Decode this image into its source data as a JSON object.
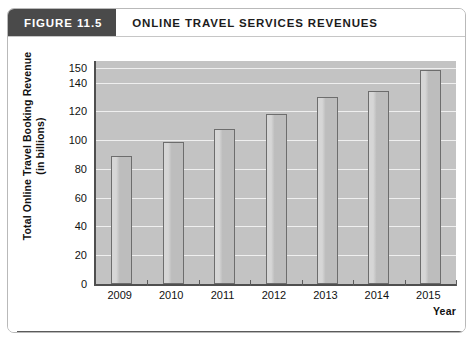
{
  "header": {
    "figure_tag": "FIGURE 11.5",
    "title": "ONLINE TRAVEL SERVICES REVENUES"
  },
  "colors": {
    "tag_background": "#4a4a4a",
    "tag_text": "#ffffff",
    "title_text": "#1c1c1c",
    "plot_background": "#c3c3c3",
    "gridline": "#efefef",
    "bar_fill": "#c0c0c0",
    "bar_border": "#6d6d6d",
    "axis": "#4f4f4f",
    "footer_rule": "#5b5b5b",
    "card_border": "#b9b9b9"
  },
  "chart_data": {
    "type": "bar",
    "title": "ONLINE TRAVEL SERVICES REVENUES",
    "xlabel": "Year",
    "ylabel": "Total Online Travel Booking Revenue (in billions)",
    "ylabel_line1": "Total Online Travel Booking Revenue",
    "ylabel_line2": "(in billions)",
    "categories": [
      "2009",
      "2010",
      "2011",
      "2012",
      "2013",
      "2014",
      "2015"
    ],
    "values": [
      89,
      99,
      108,
      118,
      130,
      134,
      149
    ],
    "ylim": [
      0,
      155
    ],
    "yticks": [
      0,
      20,
      40,
      60,
      80,
      100,
      120,
      140,
      150
    ],
    "ytick_labels": [
      "0",
      "20",
      "40",
      "60",
      "80",
      "100",
      "120",
      "140",
      "150"
    ],
    "grid": true,
    "legend": false
  }
}
